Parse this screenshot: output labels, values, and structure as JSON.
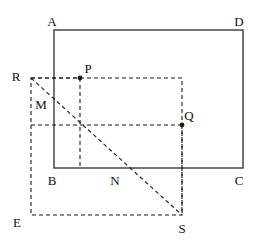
{
  "figure": {
    "kind": "geometry-diagram",
    "width": 255,
    "height": 241,
    "background_color": "#ffffff",
    "stroke_color": "#1a1a1a",
    "dash_pattern": "4 3"
  },
  "shapes": {
    "solid_rectangle": {
      "name": "ABCD",
      "x1": 54,
      "y1": 30,
      "x2": 243,
      "y2": 168,
      "stroke": "#3a3a3a",
      "stroke_width": 1.4,
      "style": "solid"
    },
    "dashed_rectangle": {
      "name": "RES-region",
      "x1": 31,
      "y1": 78,
      "x2": 182,
      "y2": 215,
      "stroke": "#1a1a1a",
      "stroke_width": 1.1,
      "style": "dashed"
    }
  },
  "segments": [
    {
      "name": "diagonal-R-S",
      "from": "R",
      "to": "S",
      "x1": 31,
      "y1": 78,
      "x2": 182,
      "y2": 215,
      "style": "dashed"
    },
    {
      "name": "horizontal-through-Q",
      "from": "left-edge",
      "to": "Q",
      "x1": 31,
      "y1": 125,
      "x2": 182,
      "y2": 125,
      "style": "dashed"
    },
    {
      "name": "horizontal-through-P",
      "from": "R",
      "to": "P",
      "x1": 31,
      "y1": 78,
      "x2": 80,
      "y2": 78,
      "style": "dashed"
    },
    {
      "name": "vertical-through-P",
      "from": "P",
      "to": "bottom-edge",
      "x1": 80,
      "y1": 78,
      "x2": 80,
      "y2": 168,
      "style": "dashed"
    },
    {
      "name": "vertical-through-Q",
      "from": "Q",
      "to": "S",
      "x1": 182,
      "y1": 125,
      "x2": 182,
      "y2": 215,
      "style": "dashed"
    }
  ],
  "points": [
    {
      "id": "P",
      "label": "P",
      "x": 80,
      "y": 78,
      "dot": true,
      "label_x": 88,
      "label_y": 68
    },
    {
      "id": "Q",
      "label": "Q",
      "x": 182,
      "y": 125,
      "dot": true,
      "label_x": 189,
      "label_y": 115
    }
  ],
  "labels": [
    {
      "id": "A",
      "text": "A",
      "x": 52,
      "y": 21
    },
    {
      "id": "D",
      "text": "D",
      "x": 239,
      "y": 21
    },
    {
      "id": "B",
      "text": "B",
      "x": 52,
      "y": 180
    },
    {
      "id": "C",
      "text": "C",
      "x": 239,
      "y": 180
    },
    {
      "id": "R",
      "text": "R",
      "x": 16,
      "y": 76
    },
    {
      "id": "M",
      "text": "M",
      "x": 41,
      "y": 104
    },
    {
      "id": "N",
      "text": "N",
      "x": 115,
      "y": 180
    },
    {
      "id": "E",
      "text": "E",
      "x": 17,
      "y": 222
    },
    {
      "id": "S",
      "text": "S",
      "x": 182,
      "y": 228
    }
  ]
}
